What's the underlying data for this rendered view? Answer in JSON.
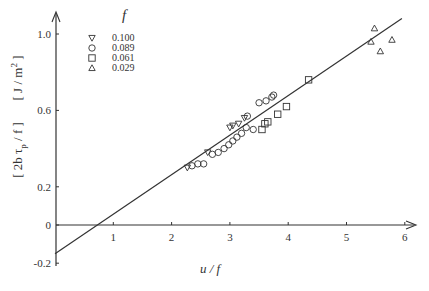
{
  "chart_data": {
    "type": "scatter",
    "title": "",
    "xlabel": "u / f",
    "ylabel": "[ 2b τp / f ]   [ J / m² ]",
    "ylabel_parts": {
      "left": "[ 2b τ",
      "sub": "p",
      "right": " / f ]",
      "unit_left": "[ J / m",
      "unit_sup": "2",
      "unit_right": " ]"
    },
    "xlim": [
      0,
      6.2
    ],
    "ylim": [
      -0.2,
      1.1
    ],
    "xticks": [
      1,
      2,
      3,
      4,
      5,
      6
    ],
    "xtick_labels": [
      "1",
      "2",
      "3",
      "4",
      "5",
      "6"
    ],
    "yticks": [
      -0.2,
      0,
      0.2,
      0.6,
      1.0
    ],
    "ytick_labels": [
      "-0.2",
      "0",
      "0.2",
      "0.6",
      "1.0"
    ],
    "grid": false,
    "legend": {
      "title": "f",
      "position": "upper-left"
    },
    "fit_line": {
      "slope": 0.207,
      "intercept": -0.15,
      "x_range": [
        0,
        5.95
      ]
    },
    "series": [
      {
        "name": "0.100",
        "marker": "triangle-down",
        "points": [
          [
            2.27,
            0.3
          ],
          [
            2.62,
            0.38
          ],
          [
            3.0,
            0.51
          ],
          [
            3.05,
            0.52
          ],
          [
            3.15,
            0.53
          ],
          [
            3.25,
            0.56
          ]
        ]
      },
      {
        "name": "0.089",
        "marker": "circle",
        "points": [
          [
            2.35,
            0.31
          ],
          [
            2.45,
            0.32
          ],
          [
            2.55,
            0.32
          ],
          [
            2.7,
            0.37
          ],
          [
            2.8,
            0.38
          ],
          [
            2.9,
            0.4
          ],
          [
            2.98,
            0.42
          ],
          [
            3.05,
            0.44
          ],
          [
            3.12,
            0.46
          ],
          [
            3.2,
            0.48
          ],
          [
            3.28,
            0.51
          ],
          [
            3.3,
            0.57
          ],
          [
            3.4,
            0.5
          ],
          [
            3.5,
            0.64
          ],
          [
            3.62,
            0.65
          ],
          [
            3.72,
            0.67
          ],
          [
            3.75,
            0.68
          ]
        ]
      },
      {
        "name": "0.061",
        "marker": "square",
        "points": [
          [
            3.55,
            0.5
          ],
          [
            3.6,
            0.53
          ],
          [
            3.65,
            0.54
          ],
          [
            3.82,
            0.58
          ],
          [
            3.97,
            0.62
          ],
          [
            4.35,
            0.76
          ]
        ]
      },
      {
        "name": "0.029",
        "marker": "triangle-up",
        "points": [
          [
            5.42,
            0.96
          ],
          [
            5.48,
            1.03
          ],
          [
            5.58,
            0.91
          ],
          [
            5.78,
            0.97
          ]
        ]
      }
    ]
  },
  "colors": {
    "ink": "#333333",
    "background": "#ffffff"
  }
}
